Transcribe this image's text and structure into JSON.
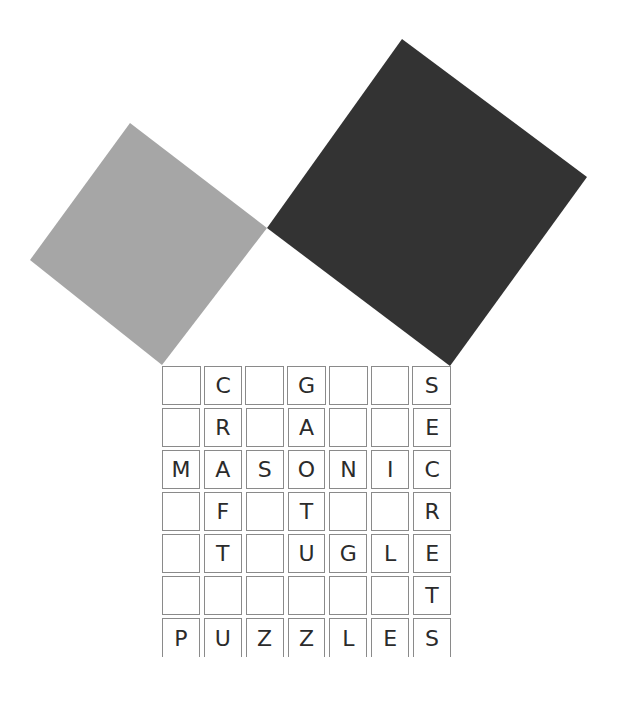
{
  "colors": {
    "light_square": "#a6a6a6",
    "dark_square": "#333333",
    "cell_border": "#8a8a8a",
    "letter": "#2b2b2b"
  },
  "shapes": {
    "light_square": "130,123 267,228 162,365 30,260",
    "dark_square": "402,39 587,177 450,366 267,228"
  },
  "grid": {
    "rows": [
      [
        "",
        "C",
        "",
        "G",
        "",
        "",
        "S"
      ],
      [
        "",
        "R",
        "",
        "A",
        "",
        "",
        "E"
      ],
      [
        "M",
        "A",
        "S",
        "O",
        "N",
        "I",
        "C"
      ],
      [
        "",
        "F",
        "",
        "T",
        "",
        "",
        "R"
      ],
      [
        "",
        "T",
        "",
        "U",
        "G",
        "L",
        "E"
      ],
      [
        "",
        "",
        "",
        "",
        "",
        "",
        "T"
      ],
      [
        "P",
        "U",
        "Z",
        "Z",
        "L",
        "E",
        "S"
      ]
    ]
  }
}
